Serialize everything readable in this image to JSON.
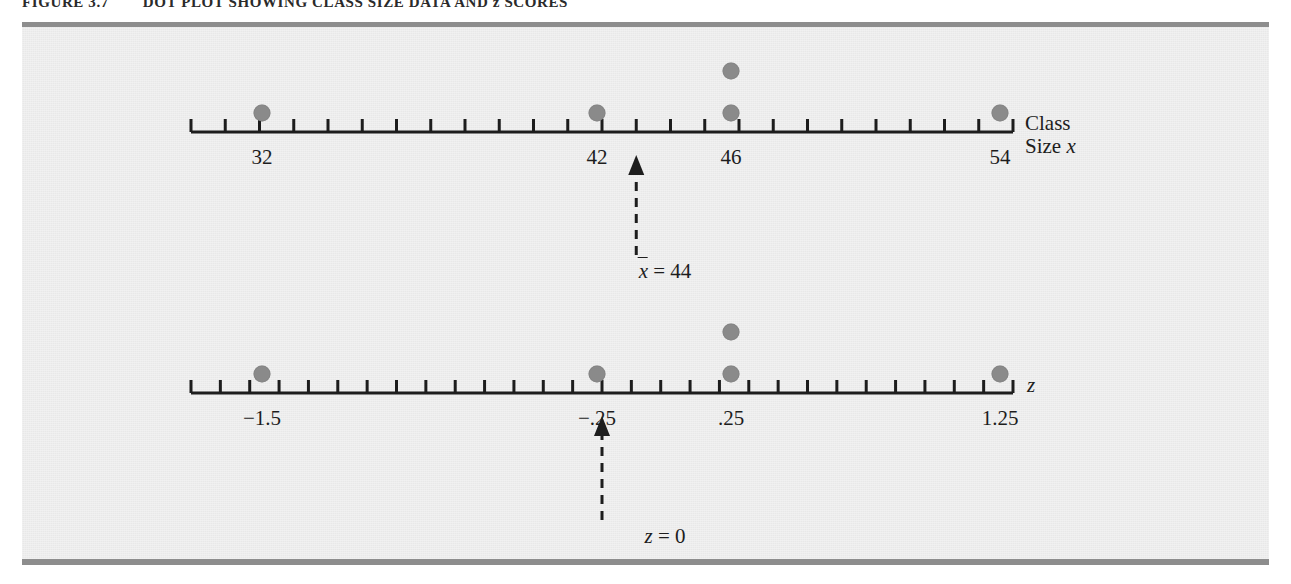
{
  "figure": {
    "number": "FIGURE 3.7",
    "title": "DOT PLOT SHOWING CLASS SIZE DATA AND z SCORES"
  },
  "colors": {
    "dot": "#8a8a8a",
    "axis": "#1d1d1d",
    "panel_background": "#e8e8e8",
    "frame_border": "#8d8d8d",
    "page_background": "#ffffff"
  },
  "chart_data": {
    "type": "scatter",
    "title": "DOT PLOT SHOWING CLASS SIZE DATA AND z SCORES",
    "grid": false,
    "legend": false,
    "axes": [
      {
        "id": "class-size-axis",
        "name": "Class Size x",
        "name_prefix": "Class",
        "name_suffix": "Size",
        "name_variable": "x",
        "xlim": [
          31,
          55
        ],
        "tick_step": 1,
        "labeled_ticks": [
          {
            "value": 32,
            "label": "32"
          },
          {
            "value": 42,
            "label": "42"
          },
          {
            "value": 46,
            "label": "46"
          },
          {
            "value": 54,
            "label": "54"
          }
        ],
        "values": [
          32,
          42,
          46,
          46,
          54
        ],
        "stacks": [
          {
            "value": 32,
            "count": 1
          },
          {
            "value": 42,
            "count": 1
          },
          {
            "value": 46,
            "count": 2
          },
          {
            "value": 54,
            "count": 1
          }
        ],
        "marker": {
          "value": 44,
          "label": "x̄ = 44",
          "label_variable": "x",
          "label_rest": " = 44"
        }
      },
      {
        "id": "z-score-axis",
        "name": "z",
        "name_variable": "z",
        "xlim": [
          -1.75,
          1.75
        ],
        "tick_step": 0.125,
        "labeled_ticks": [
          {
            "value": -1.5,
            "label": "−1.5"
          },
          {
            "value": -0.25,
            "label": "−.25"
          },
          {
            "value": 0.25,
            "label": ".25"
          },
          {
            "value": 1.25,
            "label": "1.25"
          }
        ],
        "values": [
          -1.5,
          -0.25,
          0.25,
          0.25,
          1.25
        ],
        "stacks": [
          {
            "value": -1.5,
            "count": 1
          },
          {
            "value": -0.25,
            "count": 1
          },
          {
            "value": 0.25,
            "count": 2
          },
          {
            "value": 1.25,
            "count": 1
          }
        ],
        "marker": {
          "value": 0,
          "label": "z = 0",
          "label_variable": "z",
          "label_rest": " = 0"
        }
      }
    ]
  }
}
